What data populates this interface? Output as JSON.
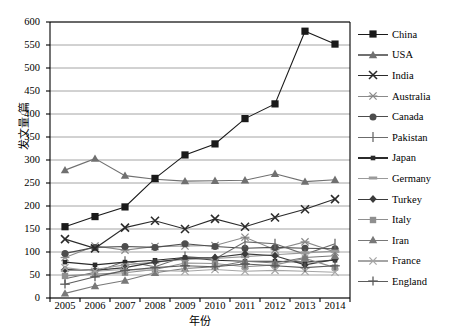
{
  "chart_data": {
    "type": "line",
    "title": "",
    "xlabel": "年份",
    "ylabel": "发文量/篇",
    "x": [
      2005,
      2006,
      2007,
      2008,
      2009,
      2010,
      2011,
      2012,
      2013,
      2014
    ],
    "xtick_labels": [
      "2005",
      "2006",
      "2007",
      "2008",
      "2009",
      "2010",
      "2011",
      "2012",
      "2013",
      "2014"
    ],
    "ytick_labels": [
      "0",
      "50",
      "100",
      "150",
      "200",
      "250",
      "300",
      "350",
      "400",
      "450",
      "500",
      "550",
      "600"
    ],
    "ylim": [
      0,
      600
    ],
    "ytick_step": 50,
    "grid": "horizontal",
    "legend_position": "right",
    "series": [
      {
        "name": "China",
        "marker": "square",
        "color": "#1a1a1a",
        "values": [
          155,
          177,
          198,
          260,
          311,
          335,
          390,
          422,
          580,
          552
        ]
      },
      {
        "name": "USA",
        "marker": "triangle",
        "color": "#707070",
        "values": [
          278,
          303,
          266,
          258,
          254,
          255,
          256,
          270,
          253,
          257
        ]
      },
      {
        "name": "India",
        "marker": "x-cross",
        "color": "#2b2b2b",
        "values": [
          128,
          108,
          153,
          168,
          150,
          172,
          155,
          175,
          193,
          215
        ]
      },
      {
        "name": "Australia",
        "marker": "star",
        "color": "#8a8a8a",
        "values": [
          88,
          113,
          104,
          112,
          113,
          114,
          132,
          105,
          122,
          100
        ]
      },
      {
        "name": "Canada",
        "marker": "circle",
        "color": "#4d4d4d",
        "values": [
          97,
          110,
          112,
          110,
          118,
          112,
          108,
          110,
          108,
          107
        ]
      },
      {
        "name": "Pakistan",
        "marker": "plus-thin",
        "color": "#6b6b6b",
        "values": [
          42,
          56,
          80,
          68,
          90,
          85,
          122,
          118,
          95,
          118
        ]
      },
      {
        "name": "Japan",
        "marker": "small-square",
        "color": "#2b2b2b",
        "values": [
          78,
          72,
          78,
          82,
          88,
          82,
          80,
          80,
          78,
          82
        ]
      },
      {
        "name": "Germany",
        "marker": "bar",
        "color": "#9a9a9a",
        "values": [
          60,
          62,
          72,
          78,
          84,
          86,
          90,
          94,
          98,
          102
        ]
      },
      {
        "name": "Turkey",
        "marker": "diamond",
        "color": "#3b3b3b",
        "values": [
          62,
          60,
          66,
          78,
          86,
          88,
          96,
          92,
          72,
          84
        ]
      },
      {
        "name": "Italy",
        "marker": "square-gray",
        "color": "#8f8f8f",
        "values": [
          48,
          52,
          55,
          62,
          76,
          75,
          68,
          72,
          86,
          66
        ]
      },
      {
        "name": "Iran",
        "marker": "triangle-gray",
        "color": "#787878",
        "values": [
          10,
          26,
          38,
          55,
          64,
          68,
          80,
          76,
          88,
          92
        ]
      },
      {
        "name": "France",
        "marker": "x-light",
        "color": "#a5a5a5",
        "values": [
          66,
          58,
          62,
          60,
          58,
          62,
          58,
          60,
          58,
          56
        ]
      },
      {
        "name": "England",
        "marker": "plus-wide",
        "color": "#5c5c5c",
        "values": [
          30,
          46,
          60,
          66,
          70,
          68,
          74,
          70,
          66,
          70
        ]
      }
    ]
  },
  "plot": {
    "left": 50,
    "right": 350,
    "top": 22,
    "bottom": 298
  }
}
